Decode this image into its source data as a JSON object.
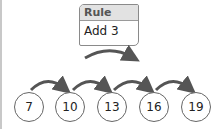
{
  "rule": {
    "title": "Rule",
    "value": "Add 3"
  },
  "sequence": [
    "7",
    "10",
    "13",
    "16",
    "19"
  ],
  "colors": {
    "arrow": "#555555",
    "header_bg": "#e2e2e2",
    "border": "#8a8a8a"
  }
}
